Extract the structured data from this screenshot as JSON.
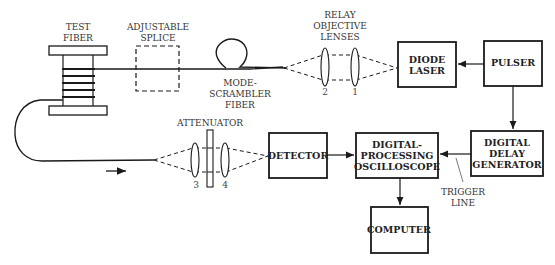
{
  "diagram": {
    "labels": {
      "test_fiber": [
        "TEST",
        "FIBER"
      ],
      "adjustable_splice": [
        "ADJUSTABLE",
        "SPLICE"
      ],
      "mode_scrambler": [
        "MODE-",
        "SCRAMBLER",
        "FIBER"
      ],
      "relay_lenses": [
        "RELAY",
        "OBJECTIVE",
        "LENSES"
      ],
      "attenuator": "ATTENUATOR",
      "trigger_line": [
        "TRIGGER",
        "LINE"
      ]
    },
    "lens_numbers": {
      "l1": "1",
      "l2": "2",
      "l3": "3",
      "l4": "4"
    },
    "blocks": {
      "diode_laser": [
        "DIODE",
        "LASER"
      ],
      "pulser": "PULSER",
      "delay_gen": [
        "DIGITAL",
        "DELAY",
        "GENERATOR"
      ],
      "oscilloscope": [
        "DIGITAL-",
        "PROCESSING",
        "OSCILLOSCOPE"
      ],
      "detector": "DETECTOR",
      "computer": "COMPUTER"
    },
    "colors": {
      "line": "#1a1a1a",
      "text": "#333333"
    }
  }
}
